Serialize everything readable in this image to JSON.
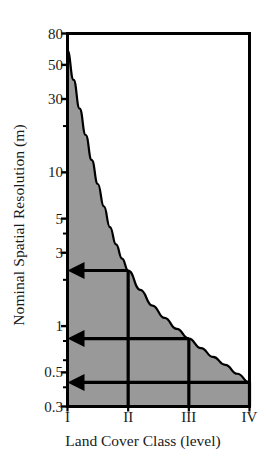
{
  "chart_data": {
    "type": "area",
    "title": "",
    "xlabel": "Land Cover Class (level)",
    "ylabel": "Nominal Spatial Resolution (m)",
    "yscale": "log",
    "ylim": [
      0.3,
      80
    ],
    "xlim": [
      1,
      4
    ],
    "grid": false,
    "legend": null,
    "x_categories": [
      "I",
      "II",
      "III",
      "IV"
    ],
    "y_tick_values": [
      80,
      50,
      30,
      20,
      10,
      5,
      4,
      3,
      2,
      1,
      0.8,
      0.6,
      0.5,
      0.4,
      0.3
    ],
    "y_tick_labels": [
      "80",
      "50",
      "30",
      "",
      "10",
      "5",
      "",
      "3",
      "",
      "1",
      "",
      "",
      "0.5",
      "",
      "0.3"
    ],
    "series": [
      {
        "name": "Maximum nominal spatial resolution boundary",
        "type": "line",
        "fill": "below",
        "fill_color": "#999999",
        "line_color": "#000000",
        "x": [
          1.0,
          1.1,
          1.2,
          1.3,
          1.4,
          1.5,
          1.6,
          1.7,
          1.8,
          1.9,
          2.0,
          2.2,
          2.4,
          2.6,
          2.8,
          3.0,
          3.2,
          3.4,
          3.6,
          3.8,
          4.0
        ],
        "y": [
          62.0,
          40.0,
          26.0,
          17.5,
          12.0,
          8.4,
          6.0,
          4.4,
          3.4,
          2.75,
          2.3,
          1.72,
          1.36,
          1.13,
          0.96,
          0.83,
          0.72,
          0.63,
          0.56,
          0.49,
          0.43
        ]
      }
    ],
    "annotations": [
      {
        "id": "arrow-level-2",
        "kind": "arrow-left-with-drop",
        "label": "",
        "y_value": 2.3,
        "x_from": 2.0,
        "x_to": 1.0,
        "drop_to_y": 0.3,
        "color": "#000000"
      },
      {
        "id": "arrow-level-3",
        "kind": "arrow-left-with-drop",
        "label": "",
        "y_value": 0.83,
        "x_from": 3.0,
        "x_to": 1.0,
        "drop_to_y": 0.3,
        "color": "#000000"
      },
      {
        "id": "arrow-level-4",
        "kind": "arrow-left-with-drop",
        "label": "",
        "y_value": 0.43,
        "x_from": 4.0,
        "x_to": 1.0,
        "drop_to_y": 0.3,
        "color": "#000000"
      }
    ],
    "colors": {
      "fill": "#999999",
      "axis": "#000000",
      "text": "#1a1a1a",
      "background": "#ffffff"
    }
  }
}
